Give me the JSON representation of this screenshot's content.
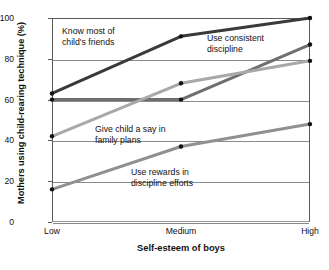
{
  "chart_data": {
    "type": "line",
    "title": "",
    "xlabel": "Self-esteem of boys",
    "ylabel": "Mothers using child-rearing technique (%)",
    "categories": [
      "Low",
      "Medium",
      "High"
    ],
    "ylim": [
      0,
      100
    ],
    "yticks": [
      0,
      20,
      40,
      60,
      80,
      100
    ],
    "grid": true,
    "legend_position": "inline-annotations",
    "series": [
      {
        "name": "Know most of child's friends",
        "values": [
          63,
          91,
          100
        ],
        "color": "#3a3a3a",
        "label_lines": [
          "Know most of",
          "child's friends"
        ]
      },
      {
        "name": "Use consistent discipline",
        "values": [
          60,
          60,
          87
        ],
        "color": "#6e6e6e",
        "label_lines": [
          "Use consistent",
          "discipline"
        ]
      },
      {
        "name": "Give child a say in family plans",
        "values": [
          42,
          68,
          79
        ],
        "color": "#a8a8a8",
        "label_lines": [
          "Give child a say in",
          "family plans"
        ]
      },
      {
        "name": "Use rewards in discipline efforts",
        "values": [
          16,
          37,
          48
        ],
        "color": "#909090",
        "label_lines": [
          "Use rewards in",
          "discipline efforts"
        ]
      }
    ],
    "marker": "circle",
    "marker_color": "#111111"
  }
}
